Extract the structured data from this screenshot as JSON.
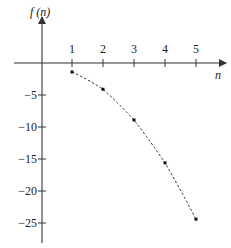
{
  "chart_data": {
    "type": "scatter",
    "title": "",
    "xlabel": "n",
    "ylabel": "f (n)",
    "x": [
      1,
      2,
      3,
      4,
      5
    ],
    "series": [
      {
        "name": "f(n)",
        "values": [
          -1.4,
          -4.1,
          -8.9,
          -15.6,
          -24.4
        ],
        "style": "dashed-connected-points"
      }
    ],
    "x_ticks": [
      "1",
      "2",
      "3",
      "4",
      "5"
    ],
    "y_ticks": [
      "-5",
      "-10",
      "-15",
      "-20",
      "-25"
    ],
    "xlim": [
      -0.9,
      6
    ],
    "ylim": [
      -28,
      9
    ],
    "grid": false,
    "legend": null
  },
  "axes": {
    "x_label": "n",
    "y_label": "f (n)",
    "color": "#333333"
  },
  "colors": {
    "line": "#333333",
    "points": "#111111"
  }
}
